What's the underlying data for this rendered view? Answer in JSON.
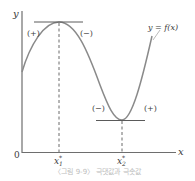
{
  "figure": {
    "caption": "〈그림 9-9〉 극댓값과 극솟값",
    "curve_label": "y = f(x)",
    "axes": {
      "x_label": "x",
      "y_label": "y",
      "origin_label": "0"
    },
    "points": {
      "maximum": {
        "label": "x",
        "subscript": "1",
        "superscript": "*"
      },
      "minimum": {
        "label": "x",
        "subscript": "2",
        "superscript": "*"
      }
    },
    "slope_signs": {
      "before_max": "(+)",
      "after_max": "(−)",
      "before_min": "(−)",
      "after_min": "(+)"
    },
    "colors": {
      "curve": "#8a8a8a",
      "axes": "#6e6e6e",
      "text": "#3a3a3a"
    }
  }
}
